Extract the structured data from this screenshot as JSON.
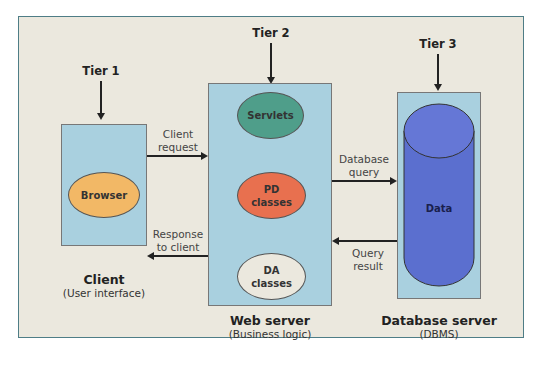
{
  "diagram": {
    "tiers": [
      {
        "label": "Tier 1"
      },
      {
        "label": "Tier 2"
      },
      {
        "label": "Tier 3"
      }
    ],
    "client": {
      "title": "Client",
      "subtitle": "(User interface)",
      "component": "Browser"
    },
    "web_server": {
      "title": "Web server",
      "subtitle": "(Business logic)",
      "components": [
        {
          "line1": "Servlets",
          "line2": ""
        },
        {
          "line1": "PD",
          "line2": "classes"
        },
        {
          "line1": "DA",
          "line2": "classes"
        }
      ]
    },
    "database_server": {
      "title": "Database server",
      "subtitle": "(DBMS)",
      "component": "Data"
    },
    "arrows": {
      "client_request": {
        "line1": "Client",
        "line2": "request"
      },
      "response_to_client": {
        "line1": "Response",
        "line2": "to client"
      },
      "database_query": {
        "line1": "Database",
        "line2": "query"
      },
      "query_result": {
        "line1": "Query",
        "line2": "result"
      }
    },
    "colors": {
      "background": "#ebe8de",
      "frame_border": "#4e7d86",
      "box_fill": "#a9d0df",
      "browser": "#f2b866",
      "servlets": "#4f9e8a",
      "pd_classes": "#e8704f",
      "da_classes": "#ebe8de",
      "data_cylinder": "#5b6fcf"
    }
  }
}
